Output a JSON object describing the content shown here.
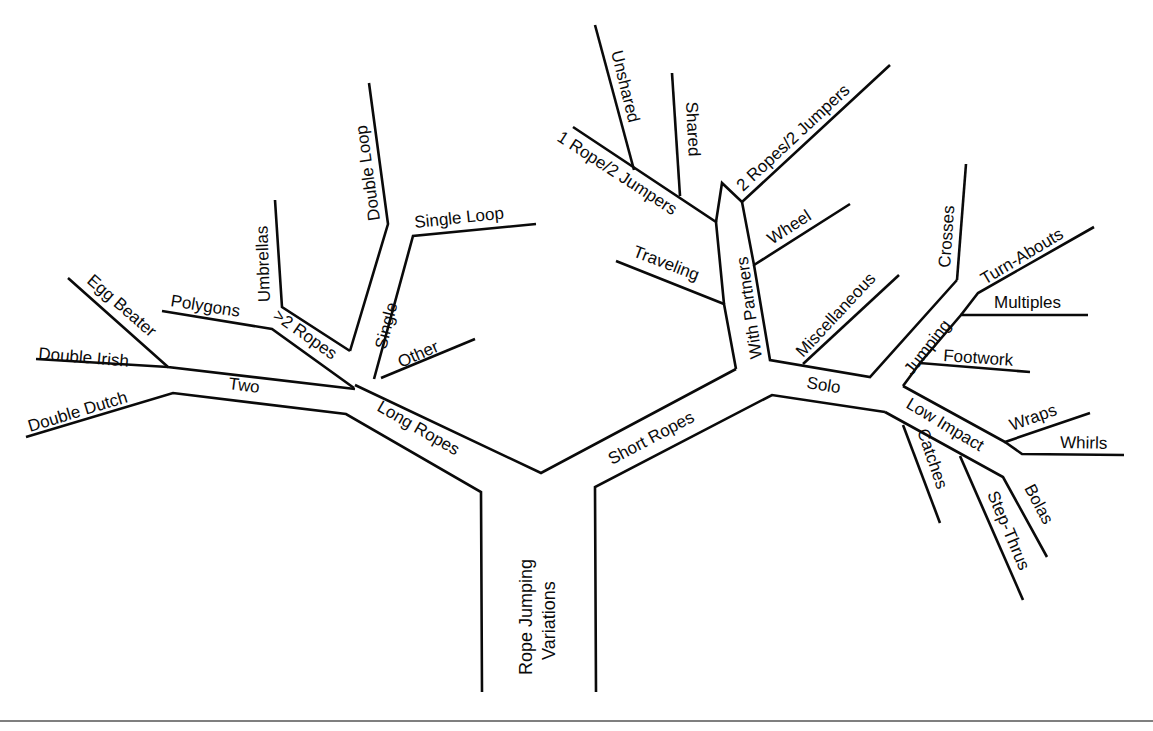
{
  "diagram": {
    "title_line1": "Rope Jumping",
    "title_line2": "Variations",
    "colors": {
      "line": "#0a0a0a",
      "background": "#ffffff",
      "rule": "#555555"
    },
    "nodes": {
      "root": "Rope Jumping Variations",
      "long_ropes": "Long Ropes",
      "short_ropes": "Short Ropes",
      "two": "Two",
      "double_dutch": "Double Dutch",
      "double_irish": "Double Irish",
      "egg_beater": "Egg Beater",
      "more_ropes": ">2 Ropes",
      "polygons": "Polygons",
      "umbrellas": "Umbrellas",
      "single": "Single",
      "double_loop": "Double Loop",
      "single_loop": "Single Loop",
      "other": "Other",
      "with_partners": "With Partners",
      "one_rope_two_jumpers": "1 Rope/2 Jumpers",
      "unshared": "Unshared",
      "shared": "Shared",
      "two_ropes_two_jumpers": "2 Ropes/2 Jumpers",
      "wheel": "Wheel",
      "traveling": "Traveling",
      "solo": "Solo",
      "miscellaneous": "Miscellaneous",
      "jumping": "Jumping",
      "crosses": "Crosses",
      "turn_abouts": "Turn-Abouts",
      "multiples": "Multiples",
      "footwork": "Footwork",
      "low_impact": "Low Impact",
      "wraps": "Wraps",
      "whirls": "Whirls",
      "catches": "Catches",
      "step_thrus": "Step-Thrus",
      "bolas": "Bolas"
    },
    "hierarchy": {
      "Rope Jumping Variations": {
        "Long Ropes": {
          "Two": [
            "Double Dutch",
            "Double Irish",
            "Egg Beater"
          ],
          ">2 Ropes": [
            "Polygons",
            "Umbrellas"
          ],
          "Single": [
            "Double Loop",
            "Single Loop"
          ],
          "Other": []
        },
        "Short Ropes": {
          "With Partners": {
            "1 Rope/2 Jumpers": [
              "Unshared",
              "Shared"
            ],
            "2 Ropes/2 Jumpers": [],
            "Wheel": [],
            "Traveling": []
          },
          "Solo": {
            "Miscellaneous": [],
            "Jumping": [
              "Crosses",
              "Turn-Abouts",
              "Multiples",
              "Footwork"
            ],
            "Low Impact": [
              "Wraps",
              "Whirls",
              "Catches",
              "Step-Thrus",
              "Bolas"
            ]
          }
        }
      }
    }
  }
}
